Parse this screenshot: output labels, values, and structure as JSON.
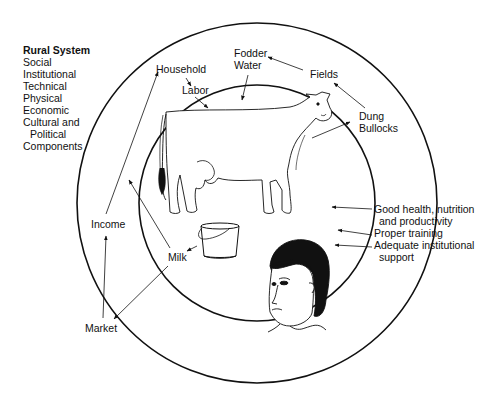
{
  "legend": {
    "title": "Rural System",
    "items": [
      "Social",
      "Institutional",
      "Technical",
      "Physical",
      "Economic",
      "Cultural and",
      "Political",
      "Components"
    ]
  },
  "labels": {
    "household": "Household",
    "labor": "Labor",
    "fodder": "Fodder",
    "water": "Water",
    "fields": "Fields",
    "dung": "Dung",
    "bullocks": "Bullocks",
    "good_health_1": "Good health, nutrition",
    "good_health_2": "and productivity",
    "proper_training": "Proper training",
    "adequate_1": "Adequate institutional",
    "adequate_2": "support",
    "income": "Income",
    "milk": "Milk",
    "market": "Market"
  },
  "figures": {
    "outer_circle": "rural-system-boundary",
    "inner_circle": "household-dairy-boundary",
    "animal": "cow-illustration",
    "container": "milk-bucket-illustration",
    "person": "woman-face-illustration"
  },
  "colors": {
    "ink": "#111111",
    "background": "#ffffff"
  }
}
